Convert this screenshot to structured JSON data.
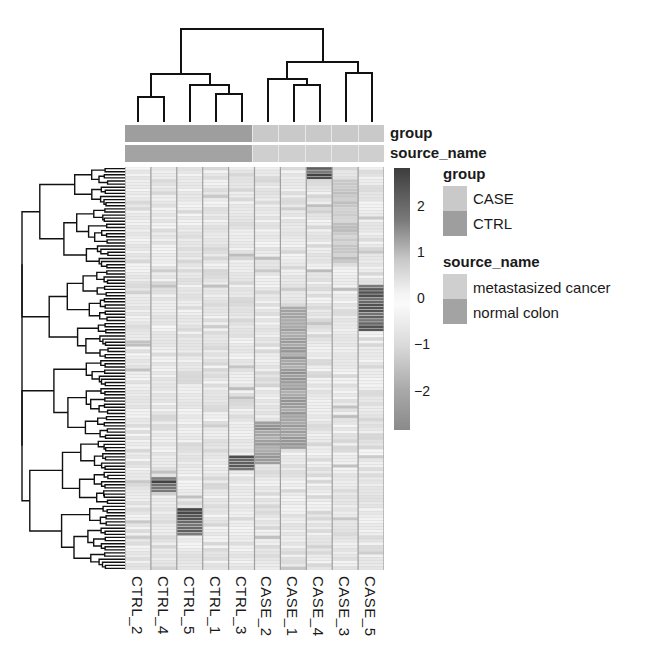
{
  "chart_data": {
    "type": "heatmap",
    "title": "",
    "columns": [
      "CTRL_2",
      "CTRL_4",
      "CTRL_5",
      "CTRL_1",
      "CTRL_3",
      "CASE_2",
      "CASE_1",
      "CASE_4",
      "CASE_3",
      "CASE_5"
    ],
    "row_count_approx": 130,
    "row_labels_shown": false,
    "column_dendrogram": {
      "merges": [
        {
          "left": "CTRL_2",
          "right": "CTRL_4",
          "height_rank": 1
        },
        {
          "left": "CTRL_1",
          "right": "CTRL_3",
          "height_rank": 2
        },
        {
          "left": "CTRL_5",
          "right": "(CTRL_1,CTRL_3)",
          "height_rank": 3
        },
        {
          "left": "(CTRL_2,CTRL_4)",
          "right": "(CTRL_5,(CTRL_1,CTRL_3))",
          "height_rank": 6
        },
        {
          "left": "CASE_1",
          "right": "CASE_4",
          "height_rank": 3
        },
        {
          "left": "CASE_2",
          "right": "(CASE_1,CASE_4)",
          "height_rank": 4
        },
        {
          "left": "CASE_3",
          "right": "CASE_5",
          "height_rank": 5
        },
        {
          "left": "(CASE_2,(CASE_1,CASE_4))",
          "right": "(CASE_3,CASE_5)",
          "height_rank": 7
        },
        {
          "left": "CTRL cluster",
          "right": "CASE cluster",
          "height_rank": 8
        }
      ]
    },
    "row_dendrogram": true,
    "color_scale": {
      "min": -2.6,
      "max": 2.6,
      "ticks": [
        2,
        1,
        0,
        -1,
        -2
      ],
      "low_color": "#8a8a8a",
      "mid_color": "#f7f7f7",
      "high_color": "#3d3d3d"
    },
    "column_annotations": {
      "group": [
        "CTRL",
        "CTRL",
        "CTRL",
        "CTRL",
        "CTRL",
        "CASE",
        "CASE",
        "CASE",
        "CASE",
        "CASE"
      ],
      "source_name": [
        "normal colon",
        "normal colon",
        "normal colon",
        "normal colon",
        "normal colon",
        "metastasized cancer",
        "metastasized cancer",
        "metastasized cancer",
        "metastasized cancer",
        "metastasized cancer"
      ]
    },
    "notable_blocks": [
      {
        "column": "CASE_5",
        "rows_approx": [
          38,
          52
        ],
        "level": "high (~2)"
      },
      {
        "column": "CASE_3",
        "rows_approx": [
          4,
          30
        ],
        "level": "low-moderate (~-1)"
      },
      {
        "column": "CASE_4",
        "rows_approx": [
          0,
          3
        ],
        "level": "high (~2)"
      },
      {
        "column": "CASE_2",
        "rows_approx": [
          82,
          95
        ],
        "level": "low (~-2)"
      },
      {
        "column": "CASE_1",
        "rows_approx": [
          45,
          90
        ],
        "level": "low (~-1 to -2)"
      },
      {
        "column": "CTRL_4",
        "rows_approx": [
          100,
          104
        ],
        "level": "high (~2)"
      },
      {
        "column": "CTRL_5",
        "rows_approx": [
          110,
          118
        ],
        "level": "high (~2)"
      },
      {
        "column": "CTRL_3",
        "rows_approx": [
          93,
          97
        ],
        "level": "high (~2)"
      }
    ]
  },
  "annotations": {
    "bar_labels": [
      "group",
      "source_name"
    ],
    "group_colors": {
      "CASE": "#c9c9c9",
      "CTRL": "#9e9e9e"
    },
    "source_colors": {
      "metastasized cancer": "#cfcfcf",
      "normal colon": "#a3a3a3"
    }
  },
  "legend": {
    "group": {
      "title": "group",
      "items": [
        "CASE",
        "CTRL"
      ]
    },
    "source": {
      "title": "source_name",
      "items": [
        "metastasized cancer",
        "normal colon"
      ]
    },
    "colorbar_ticks": [
      "2",
      "1",
      "0",
      "−1",
      "−2"
    ]
  }
}
